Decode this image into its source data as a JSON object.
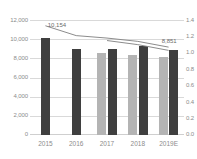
{
  "chart_data": {
    "type": "bar",
    "title": "",
    "subtitle": "",
    "xlabel": "",
    "ylabel": "",
    "grid": true,
    "legend": "none",
    "categories": [
      "2015",
      "2016",
      "2017",
      "2018",
      "2019E"
    ],
    "left_axis": {
      "label": "",
      "ylim": [
        0,
        12000
      ],
      "ticks": [
        0,
        2000,
        4000,
        6000,
        8000,
        10000,
        12000
      ],
      "tick_labels": [
        "0",
        "2,000",
        "4,000",
        "6,000",
        "8,000",
        "10,000",
        "12,000"
      ]
    },
    "right_axis": {
      "label": "",
      "ylim": [
        0,
        1.4
      ],
      "ticks": [
        0.0,
        0.2,
        0.4,
        0.6,
        0.8,
        1.0,
        1.2,
        1.4
      ],
      "tick_labels": [
        "0.0",
        "0.2",
        "0.4",
        "0.6",
        "0.8",
        "1.0",
        "1.2",
        "1.4"
      ]
    },
    "series": [
      {
        "name": "series-light-bars",
        "type": "bar",
        "axis": "left",
        "color": "#b4b4b4",
        "values": [
          null,
          null,
          8550,
          8400,
          8150
        ]
      },
      {
        "name": "series-dark-bars",
        "type": "bar",
        "axis": "left",
        "color": "#3f3f3f",
        "values": [
          10154,
          8950,
          8950,
          9280,
          8851
        ]
      },
      {
        "name": "series-line-upper",
        "type": "line",
        "axis": "right",
        "color": "#8c8c8c",
        "values": [
          1.33,
          1.21,
          1.18,
          1.14,
          1.07
        ]
      },
      {
        "name": "series-line-lower",
        "type": "line",
        "axis": "right",
        "color": "#8c8c8c",
        "values": [
          null,
          null,
          1.15,
          1.1,
          1.03
        ]
      }
    ],
    "data_labels": [
      {
        "name": "label-2015-dark-bar",
        "text": "10,154",
        "x": 0.115,
        "y": 1.295
      },
      {
        "name": "label-2019e-dark-bar",
        "text": "8,851",
        "x": 0.855,
        "y": 1.1
      }
    ]
  }
}
